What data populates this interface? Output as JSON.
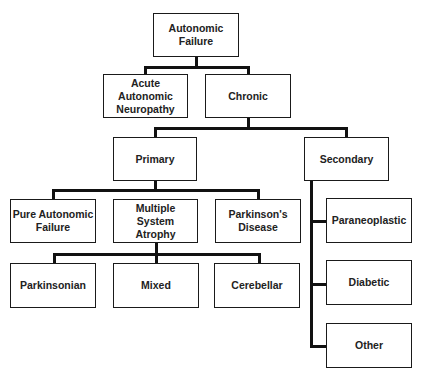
{
  "diagram": {
    "type": "hierarchy",
    "nodes": {
      "root": "Autonomic Failure",
      "acute": "Acute Autonomic Neuropathy",
      "chronic": "Chronic",
      "primary": "Primary",
      "secondary": "Secondary",
      "pure": "Pure Autonomic Failure",
      "msa": "Multiple System Atrophy",
      "parkinsons": "Parkinson's Disease",
      "parkinsonian": "Parkinsonian",
      "mixed": "Mixed",
      "cerebellar": "Cerebellar",
      "paraneoplastic": "Paraneoplastic",
      "diabetic": "Diabetic",
      "other": "Other"
    },
    "edges": [
      [
        "Autonomic Failure",
        "Acute Autonomic Neuropathy"
      ],
      [
        "Autonomic Failure",
        "Chronic"
      ],
      [
        "Chronic",
        "Primary"
      ],
      [
        "Chronic",
        "Secondary"
      ],
      [
        "Primary",
        "Pure Autonomic Failure"
      ],
      [
        "Primary",
        "Multiple System Atrophy"
      ],
      [
        "Primary",
        "Parkinson's Disease"
      ],
      [
        "Multiple System Atrophy",
        "Parkinsonian"
      ],
      [
        "Multiple System Atrophy",
        "Mixed"
      ],
      [
        "Multiple System Atrophy",
        "Cerebellar"
      ],
      [
        "Secondary",
        "Paraneoplastic"
      ],
      [
        "Secondary",
        "Diabetic"
      ],
      [
        "Secondary",
        "Other"
      ]
    ]
  }
}
